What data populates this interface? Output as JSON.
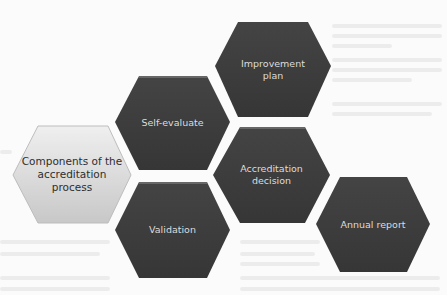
{
  "diagram": {
    "title": "Components of the accreditation process",
    "center": {
      "label": "Components of the\naccreditation\nprocess",
      "style": "light"
    },
    "nodes": [
      {
        "id": "improvement-plan",
        "label": "Improvement\nplan"
      },
      {
        "id": "self-evaluate",
        "label": "Self-evaluate"
      },
      {
        "id": "accreditation-decision",
        "label": "Accreditation\ndecision"
      },
      {
        "id": "validation",
        "label": "Validation"
      },
      {
        "id": "annual-report",
        "label": "Annual report"
      }
    ],
    "colors": {
      "dark_fill": "#3f3f3f",
      "dark_text": "#dcdcdc",
      "light_fill_top": "#eeeeee",
      "light_fill_bottom": "#c9c9c9",
      "light_text": "#2e2e2e",
      "background": "#fbfbfb"
    }
  }
}
